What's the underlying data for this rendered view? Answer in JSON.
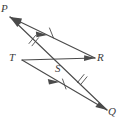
{
  "figure": {
    "background_color": "#ffffff",
    "stroke_color": "#4a4a4a",
    "label_color": "#3b3b3b",
    "points": [
      {
        "id": "P",
        "label": "P",
        "x": 10,
        "y": 17
      },
      {
        "id": "R",
        "label": "R",
        "x": 95,
        "y": 58
      },
      {
        "id": "T",
        "label": "T",
        "x": 22,
        "y": 60
      },
      {
        "id": "S",
        "label": "S",
        "x": 60,
        "y": 64
      },
      {
        "id": "Q",
        "label": "Q",
        "x": 107,
        "y": 110
      }
    ],
    "segments": [
      {
        "id": "PR",
        "from": "P",
        "to": "R",
        "arrow_at": "P",
        "tick_marks": 0
      },
      {
        "id": "TR",
        "from": "T",
        "to": "R",
        "arrow_at": "R",
        "tick_marks": 0
      },
      {
        "id": "TQ",
        "from": "T",
        "to": "Q",
        "arrow_at": "mid",
        "tick_marks": 1
      },
      {
        "id": "PQ",
        "from": "P",
        "to": "Q",
        "arrow_at": "Q",
        "tick_marks": 0
      }
    ],
    "tick_annotations": [
      {
        "id": "tick-ps",
        "segment": "PQ",
        "count": 2,
        "x": 32,
        "y": 40
      },
      {
        "id": "tick-sr",
        "segment": "PR",
        "count": 1,
        "x": 49,
        "y": 31
      },
      {
        "id": "tick-ts",
        "segment": "TQ",
        "count": 1,
        "x": 64,
        "y": 83
      },
      {
        "id": "tick-sq",
        "segment": "PQ",
        "count": 2,
        "x": 80,
        "y": 79
      }
    ],
    "labels": {
      "p": "P",
      "r": "R",
      "t": "T",
      "s": "S",
      "q": "Q"
    }
  }
}
